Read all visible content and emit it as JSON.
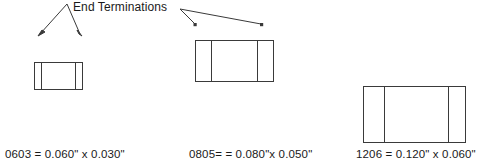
{
  "diagram": {
    "title_callout": "End Terminations",
    "line_color": "#3a3a3a",
    "text_color": "#1a1a1a",
    "background": "#ffffff",
    "components": [
      {
        "id": "0603",
        "caption": "0603 = 0.060\" x 0.030\"",
        "code": "0603",
        "length_in": "0.060\"",
        "width_in": "0.030\"",
        "body": {
          "x": 34,
          "y": 62,
          "w": 48,
          "h": 27
        },
        "terminations": [
          {
            "x": 41
          },
          {
            "x": 75
          }
        ]
      },
      {
        "id": "0805",
        "caption": "0805= = 0.080\"x 0.050\"",
        "code": "0805",
        "length_in": "0.080\"",
        "width_in": "0.050\"",
        "body": {
          "x": 195,
          "y": 40,
          "w": 78,
          "h": 41
        },
        "terminations": [
          {
            "x": 211
          },
          {
            "x": 257
          }
        ]
      },
      {
        "id": "1206",
        "caption": "1206 = 0.120\" x 0.060\"",
        "code": "1206",
        "length_in": "0.120\"",
        "width_in": "0.060\"",
        "body": {
          "x": 363,
          "y": 86,
          "w": 102,
          "h": 56
        },
        "terminations": [
          {
            "x": 384
          },
          {
            "x": 448
          }
        ]
      }
    ],
    "pointers": [
      {
        "name": "pointer-0603-left",
        "x1": 67,
        "y1": 4,
        "x2": 39,
        "y2": 35
      },
      {
        "name": "pointer-0603-right",
        "x1": 67,
        "y1": 4,
        "x2": 81,
        "y2": 35
      },
      {
        "name": "pointer-0805-left",
        "x1": 179,
        "y1": 8,
        "x2": 195,
        "y2": 25
      },
      {
        "name": "pointer-0805-right",
        "x1": 179,
        "y1": 8,
        "x2": 262,
        "y2": 25
      }
    ]
  }
}
